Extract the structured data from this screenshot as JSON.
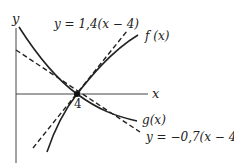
{
  "diagram": {
    "axes": {
      "x_label": "x",
      "y_label": "y",
      "tick_label": "4"
    },
    "curves": {
      "f_label": "f (x)",
      "g_label": "g(x)"
    },
    "tangents": {
      "t1_label": "y = 1,4(x − 4)",
      "t2_label": "y = −0,7(x − 4)"
    },
    "point": {
      "x": 4,
      "y": 0
    },
    "colors": {
      "line": "#222222",
      "axis": "#555555",
      "background": "#ffffff"
    }
  }
}
